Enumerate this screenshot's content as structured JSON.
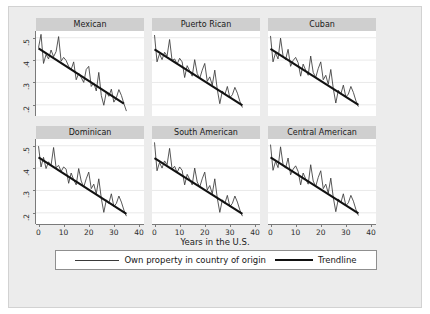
{
  "chart_data": {
    "type": "line",
    "title": "",
    "xlabel": "Years in the U.S.",
    "ylabel": "",
    "xlim": [
      -1,
      42
    ],
    "ylim": [
      0.15,
      0.53
    ],
    "xticks": [
      0,
      10,
      20,
      30,
      40
    ],
    "xticklabels": [
      "0",
      "10",
      "20",
      "30",
      "40"
    ],
    "yticks": [
      0.2,
      0.3,
      0.4,
      0.5
    ],
    "yticklabels": [
      ".2",
      ".3",
      ".4",
      ".5"
    ],
    "grid": true,
    "legend_position": "bottom",
    "legend": [
      {
        "label": "Own property in country of origin",
        "style": "thin-line",
        "color": "#3a3a3a"
      },
      {
        "label": "Trendline",
        "style": "thick-line",
        "color": "#111111"
      }
    ],
    "panel_layout": {
      "rows": 2,
      "cols": 3
    },
    "x": [
      0,
      1,
      2,
      3,
      4,
      5,
      6,
      7,
      8,
      9,
      10,
      11,
      12,
      13,
      14,
      15,
      16,
      17,
      18,
      19,
      20,
      21,
      22,
      23,
      24,
      25,
      26,
      27,
      28,
      29,
      30,
      31,
      32,
      33,
      34,
      35
    ],
    "panels": [
      {
        "title": "Mexican",
        "series": [
          {
            "name": "Own property in country of origin",
            "values": [
              0.455,
              0.515,
              0.385,
              0.425,
              0.405,
              0.445,
              0.415,
              0.438,
              0.505,
              0.395,
              0.412,
              0.398,
              0.372,
              0.358,
              0.392,
              0.312,
              0.341,
              0.322,
              0.3,
              0.358,
              0.372,
              0.282,
              0.298,
              0.262,
              0.345,
              0.242,
              0.198,
              0.258,
              0.238,
              0.27,
              0.212,
              0.232,
              0.268,
              0.242,
              0.205,
              0.172
            ]
          }
        ],
        "trendline": {
          "name": "Trendline",
          "x0": 0,
          "y0": 0.452,
          "x1": 34,
          "y1": 0.205
        }
      },
      {
        "title": "Puerto Rican",
        "series": [
          {
            "name": "Own property in country of origin",
            "values": [
              0.512,
              0.392,
              0.428,
              0.402,
              0.435,
              0.418,
              0.492,
              0.398,
              0.405,
              0.382,
              0.408,
              0.392,
              0.322,
              0.375,
              0.352,
              0.328,
              0.402,
              0.34,
              0.318,
              0.355,
              0.385,
              0.305,
              0.325,
              0.288,
              0.355,
              0.268,
              0.205,
              0.262,
              0.245,
              0.282,
              0.232,
              0.245,
              0.278,
              0.252,
              0.215,
              0.188
            ]
          }
        ],
        "trendline": {
          "name": "Trendline",
          "x0": 0,
          "y0": 0.448,
          "x1": 35,
          "y1": 0.198
        }
      },
      {
        "title": "Cuban",
        "series": [
          {
            "name": "Own property in country of origin",
            "values": [
              0.508,
              0.392,
              0.432,
              0.405,
              0.498,
              0.418,
              0.402,
              0.448,
              0.372,
              0.398,
              0.412,
              0.388,
              0.328,
              0.382,
              0.355,
              0.332,
              0.418,
              0.345,
              0.322,
              0.362,
              0.392,
              0.312,
              0.332,
              0.292,
              0.358,
              0.272,
              0.208,
              0.265,
              0.248,
              0.288,
              0.235,
              0.248,
              0.282,
              0.255,
              0.218,
              0.192
            ]
          }
        ],
        "trendline": {
          "name": "Trendline",
          "x0": 0,
          "y0": 0.45,
          "x1": 35,
          "y1": 0.2
        }
      },
      {
        "title": "Dominican",
        "series": [
          {
            "name": "Own property in country of origin",
            "values": [
              0.498,
              0.405,
              0.448,
              0.398,
              0.428,
              0.412,
              0.492,
              0.402,
              0.412,
              0.385,
              0.405,
              0.395,
              0.332,
              0.378,
              0.348,
              0.325,
              0.398,
              0.342,
              0.315,
              0.352,
              0.382,
              0.308,
              0.328,
              0.285,
              0.352,
              0.265,
              0.202,
              0.258,
              0.242,
              0.285,
              0.228,
              0.242,
              0.275,
              0.248,
              0.212,
              0.185
            ]
          }
        ],
        "trendline": {
          "name": "Trendline",
          "x0": 0,
          "y0": 0.448,
          "x1": 35,
          "y1": 0.195
        }
      },
      {
        "title": "South American",
        "series": [
          {
            "name": "Own property in country of origin",
            "values": [
              0.515,
              0.388,
              0.425,
              0.4,
              0.432,
              0.415,
              0.488,
              0.395,
              0.408,
              0.38,
              0.405,
              0.39,
              0.325,
              0.372,
              0.35,
              0.325,
              0.4,
              0.338,
              0.315,
              0.352,
              0.382,
              0.302,
              0.322,
              0.285,
              0.352,
              0.265,
              0.202,
              0.258,
              0.242,
              0.278,
              0.228,
              0.242,
              0.275,
              0.248,
              0.212,
              0.185
            ]
          }
        ],
        "trendline": {
          "name": "Trendline",
          "x0": 0,
          "y0": 0.445,
          "x1": 35,
          "y1": 0.195
        }
      },
      {
        "title": "Central American",
        "series": [
          {
            "name": "Own property in country of origin",
            "values": [
              0.505,
              0.39,
              0.43,
              0.402,
              0.495,
              0.415,
              0.4,
              0.445,
              0.37,
              0.395,
              0.41,
              0.385,
              0.325,
              0.378,
              0.352,
              0.328,
              0.415,
              0.342,
              0.318,
              0.358,
              0.388,
              0.308,
              0.328,
              0.288,
              0.355,
              0.268,
              0.205,
              0.262,
              0.245,
              0.285,
              0.232,
              0.245,
              0.278,
              0.252,
              0.215,
              0.188
            ]
          }
        ],
        "trendline": {
          "name": "Trendline",
          "x0": 0,
          "y0": 0.448,
          "x1": 35,
          "y1": 0.198
        }
      }
    ]
  }
}
